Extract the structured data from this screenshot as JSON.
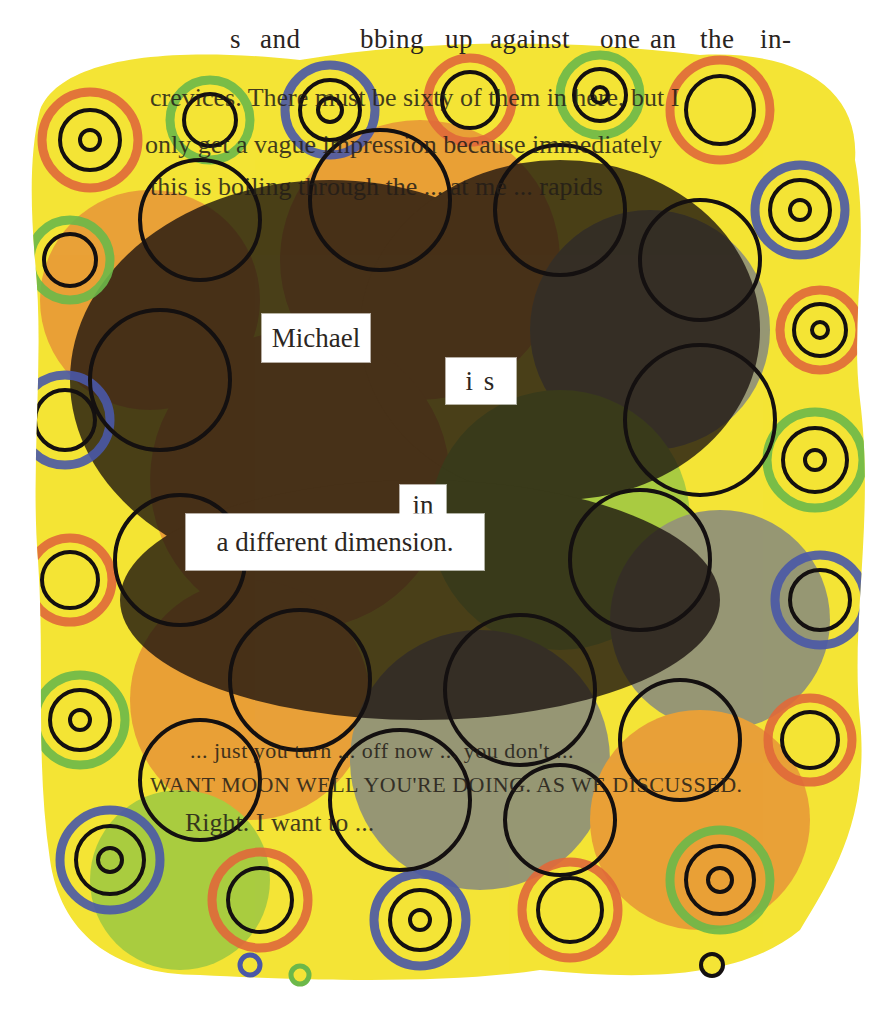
{
  "artwork": {
    "type": "blackout-poetry",
    "background_color": "#ffffff",
    "palette": {
      "yellow": "#f7ea2e",
      "orange": "#e0693a",
      "blue": "#4a58a8",
      "green": "#6cb84a",
      "ink": "#141010",
      "paper_text": "#2a2420"
    }
  },
  "top_line": {
    "fragments": [
      "s",
      "and",
      "bbing",
      "up",
      "against",
      "one",
      "an",
      "the",
      "in-"
    ]
  },
  "obscured_lines": [
    "crevices. There must be sixty of them in here, but I",
    "only get a vague impression because immediately",
    "this is boiling through the ... at me ... rapids",
    "WANT MOON WELL YOU'RE DOING. AS WE DISCUSSED.",
    "Right. I want to ...",
    "... just you turn ... off now ... you don't ..."
  ],
  "poem": {
    "words": [
      {
        "text": "Michael"
      },
      {
        "text": "i s"
      },
      {
        "text": "in"
      },
      {
        "text": "a different dimension."
      }
    ]
  }
}
